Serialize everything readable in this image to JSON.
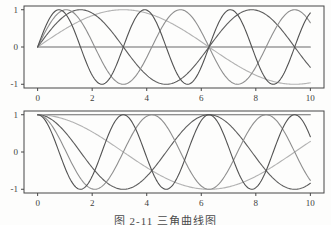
{
  "figure": {
    "caption": "图 2-11 三角曲线图",
    "paper_color": "#fdfdfc",
    "axis_color": "#474747",
    "tick_label_color": "#3d3d3d"
  },
  "chart_data": [
    {
      "type": "line",
      "subplot": "top",
      "title": "",
      "xlabel": "",
      "ylabel": "",
      "xlim": [
        -0.5,
        10.5
      ],
      "ylim": [
        -1.1,
        1.1
      ],
      "x_data_range": [
        0,
        10
      ],
      "xticks": [
        0,
        2,
        4,
        6,
        8,
        10
      ],
      "yticks": [
        1,
        0,
        -1
      ],
      "grid": false,
      "legend": "none",
      "frame": "box",
      "series": [
        {
          "name": "sin(0.0x)",
          "function": "sin",
          "frequency": 0.0,
          "color": "#6b6b6b"
        },
        {
          "name": "sin(0.5x)",
          "function": "sin",
          "frequency": 0.5,
          "color": "#b2b2b2"
        },
        {
          "name": "sin(1.0x)",
          "function": "sin",
          "frequency": 1.0,
          "color": "#5d5d5d"
        },
        {
          "name": "sin(1.5x)",
          "function": "sin",
          "frequency": 1.5,
          "color": "#8e8e8e"
        },
        {
          "name": "sin(2.0x)",
          "function": "sin",
          "frequency": 2.0,
          "color": "#525252"
        }
      ]
    },
    {
      "type": "line",
      "subplot": "bottom",
      "title": "",
      "xlabel": "",
      "ylabel": "",
      "xlim": [
        -0.5,
        10.5
      ],
      "ylim": [
        -1.1,
        1.1
      ],
      "x_data_range": [
        0,
        10
      ],
      "xticks": [
        0,
        2,
        4,
        6,
        8,
        10
      ],
      "yticks": [
        1,
        0,
        -1
      ],
      "grid": false,
      "legend": "none",
      "frame": "box",
      "series": [
        {
          "name": "cos(0.0x)",
          "function": "cos",
          "frequency": 0.0,
          "color": "#6b6b6b"
        },
        {
          "name": "cos(0.5x)",
          "function": "cos",
          "frequency": 0.5,
          "color": "#b2b2b2"
        },
        {
          "name": "cos(1.0x)",
          "function": "cos",
          "frequency": 1.0,
          "color": "#5d5d5d"
        },
        {
          "name": "cos(1.5x)",
          "function": "cos",
          "frequency": 1.5,
          "color": "#8e8e8e"
        },
        {
          "name": "cos(2.0x)",
          "function": "cos",
          "frequency": 2.0,
          "color": "#525252"
        }
      ]
    }
  ]
}
